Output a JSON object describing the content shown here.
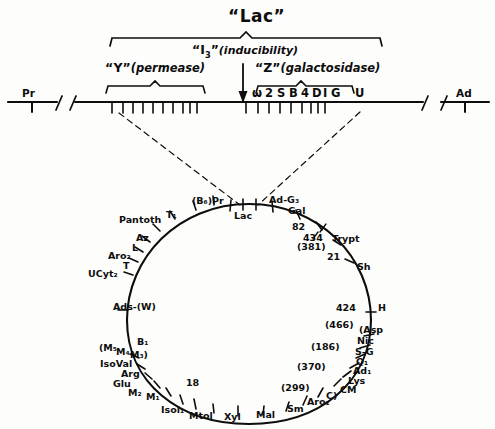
{
  "figure": {
    "kind": "genetic-linkage-map",
    "title_top": "“Lac”",
    "ink_color": "#0d0d0d",
    "paper_color": "#fdfdfc"
  },
  "linear_map": {
    "left_end_label": "Pr",
    "right_end_label": "Ad",
    "brackets": [
      {
        "name": "lac",
        "label": "“Lac”"
      },
      {
        "name": "y-permease",
        "label_gene": "“Y”",
        "label_function": "(permease)"
      },
      {
        "name": "z-galactosidase",
        "label_gene": "“Z”",
        "label_function": "(galactosidase)"
      }
    ],
    "inducibility": {
      "label_gene": "“I",
      "label_sub": "3",
      "label_close": "”",
      "label_function": "(inducibility)"
    },
    "z_markers": [
      "ω",
      "2",
      "S",
      "B",
      "4",
      "D",
      "I",
      "G"
    ],
    "u_marker": "U"
  },
  "circular_map": {
    "markers": [
      {
        "label": "Lac"
      },
      {
        "label": "(B",
        "sub": "6",
        "label2": ")Pr"
      },
      {
        "label": "T",
        "sub": "1"
      },
      {
        "label": "Pantoth"
      },
      {
        "label": "Az"
      },
      {
        "label": "L"
      },
      {
        "label": "Aro",
        "sub": "2"
      },
      {
        "label": "T"
      },
      {
        "label": "UCyt",
        "sub": "2"
      },
      {
        "label": "Ads-(W)"
      },
      {
        "label": "B",
        "sub": "1"
      },
      {
        "label": "(M",
        "sub": "5"
      },
      {
        "label": "M",
        "sub": "4"
      },
      {
        "label": "M",
        "sub": "3",
        "label2": ")"
      },
      {
        "label": "IsoVal"
      },
      {
        "label": "Arg"
      },
      {
        "label": "Glu"
      },
      {
        "label": "M",
        "sub": "2"
      },
      {
        "label": "M",
        "sub": "1"
      },
      {
        "label": "18"
      },
      {
        "label": "Isol",
        "sub": "1"
      },
      {
        "label": "Mtol"
      },
      {
        "label": "Xyl"
      },
      {
        "label": "Mal"
      },
      {
        "label": "Sm"
      },
      {
        "label": "Aro",
        "sub": "1"
      },
      {
        "label": "C)"
      },
      {
        "label": "(299)"
      },
      {
        "label": "(370)"
      },
      {
        "label": "Lys"
      },
      {
        "label": "CM"
      },
      {
        "label": "Ad",
        "sub": "1"
      },
      {
        "label": "Q",
        "sub": "1"
      },
      {
        "label": "S-G"
      },
      {
        "label": "Nic"
      },
      {
        "label": "(Asp"
      },
      {
        "label": "(186)"
      },
      {
        "label": "(466)"
      },
      {
        "label": "424"
      },
      {
        "label": "H"
      },
      {
        "label": "Sh"
      },
      {
        "label": "21"
      },
      {
        "label": "Trypt"
      },
      {
        "label": "(381)"
      },
      {
        "label": "434"
      },
      {
        "label": "82"
      },
      {
        "label": "Gal"
      },
      {
        "label": "Ad-G",
        "sub": "3"
      }
    ],
    "labels_flat": {
      "lac": "Lac",
      "b6pr": "(B₆)Pr",
      "t1": "T₁",
      "pantoth": "Pantoth",
      "az": "Az",
      "l": "L",
      "aro2": "Aro₂",
      "t": "T",
      "ucyt2": "UCyt₂",
      "ads_w": "Ads-(W)",
      "b1": "B₁",
      "m5": "(M₅",
      "m4": "M₄",
      "m3": "M₃)",
      "isoval": "IsoVal",
      "arg": "Arg",
      "glu": "Glu",
      "m2": "M₂",
      "m1": "M₁",
      "n18": "18",
      "isol1": "Isol₁",
      "mtol": "Mtol",
      "xyl": "Xyl",
      "mal": "Mal",
      "sm": "Sm",
      "aro1": "Aro₁",
      "c_close": "C)",
      "n299": "(299)",
      "n370": "(370)",
      "lys": "Lys",
      "cm": "CM",
      "ad1": "Ad₁",
      "q1": "Q₁",
      "sg": "S-G",
      "nic": "Nic",
      "asp": "(Asp",
      "n186": "(186)",
      "n466": "(466)",
      "n424": "424",
      "h": "H",
      "sh": "Sh",
      "n21": "21",
      "trypt": "Trypt",
      "n381": "(381)",
      "n434": "434",
      "n82": "82",
      "gal": "Gal",
      "adg3": "Ad-G₃"
    }
  }
}
